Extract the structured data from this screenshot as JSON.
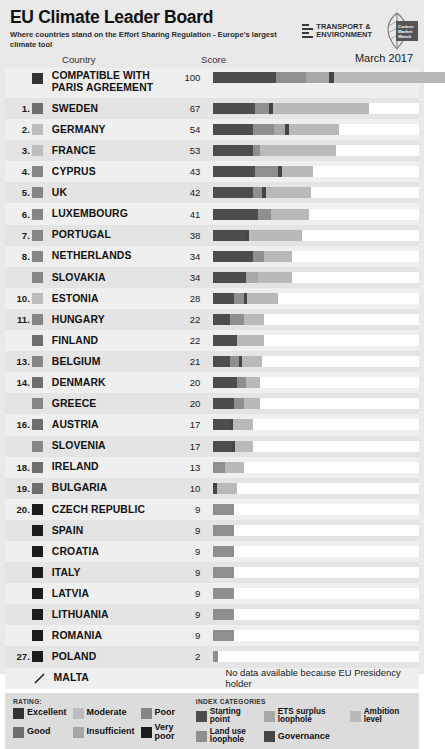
{
  "header": {
    "title": "EU Climate Leader Board",
    "subtitle": "Where countries stand on the Effort Sharing Regulation - Europe's largest climate tool",
    "org_logo_text": "TRANSPORT & ENVIRONMENT",
    "org_logo_line1": "TRANSPORT &",
    "org_logo_line2": "ENVIRONMENT",
    "cmw_line1": "Carbon",
    "cmw_line2": "Market",
    "cmw_line3": "Watch",
    "date": "March 2017"
  },
  "columns": {
    "country": "Country",
    "score": "Score"
  },
  "colors": {
    "starting_point": "#4d4d4d",
    "land_use": "#8f8f8f",
    "ets_surplus": "#a8a8a8",
    "governance": "#454545",
    "ambition": "#b9b9b9",
    "rating_excellent": "#333333",
    "rating_good": "#6e6e6e",
    "rating_moderate": "#bdbdbd",
    "rating_insufficient": "#a5a5a5",
    "rating_poor": "#858585",
    "rating_very_poor": "#1c1c1c",
    "bar_track": "#ffffff",
    "page_background": "#e9e9e9"
  },
  "chart_data": {
    "type": "bar",
    "title": "EU Climate Leader Board",
    "subtitle": "Where countries stand on the Effort Sharing Regulation - Europe's largest climate tool",
    "xlabel": "Score",
    "ylabel": "Country",
    "xlim": [
      0,
      100
    ],
    "grid": false,
    "legend": "bottom",
    "stacked": true,
    "segment_names": [
      "Starting point",
      "Land use loophole",
      "ETS surplus loophole",
      "Governance",
      "Ambition level"
    ],
    "categories": [
      "COMPATIBLE WITH PARIS AGREEMENT",
      "SWEDEN",
      "GERMANY",
      "FRANCE",
      "CYPRUS",
      "UK",
      "LUXEMBOURG",
      "PORTUGAL",
      "NETHERLANDS",
      "SLOVAKIA",
      "ESTONIA",
      "HUNGARY",
      "FINLAND",
      "BELGIUM",
      "DENMARK",
      "GREECE",
      "AUSTRIA",
      "SLOVENIA",
      "IRELAND",
      "BULGARIA",
      "CZECH REPUBLIC",
      "SPAIN",
      "CROATIA",
      "ITALY",
      "LATVIA",
      "LITHUANIA",
      "ROMANIA",
      "POLAND",
      "MALTA"
    ],
    "values": [
      100,
      67,
      54,
      53,
      43,
      42,
      41,
      38,
      34,
      34,
      28,
      22,
      22,
      21,
      20,
      20,
      17,
      17,
      13,
      10,
      9,
      9,
      9,
      9,
      9,
      9,
      9,
      2,
      null
    ]
  },
  "rows": [
    {
      "rank": "",
      "country": "COMPATIBLE WITH PARIS AGREEMENT",
      "score": "100",
      "rating": "excellent",
      "segments": [
        {
          "cat": "starting_point",
          "v": 27
        },
        {
          "cat": "land_use",
          "v": 13
        },
        {
          "cat": "ets_surplus",
          "v": 10
        },
        {
          "cat": "governance",
          "v": 2
        },
        {
          "cat": "ambition",
          "v": 48
        }
      ]
    },
    {
      "rank": "1.",
      "country": "SWEDEN",
      "score": "67",
      "rating": "good",
      "segments": [
        {
          "cat": "starting_point",
          "v": 18
        },
        {
          "cat": "land_use",
          "v": 6
        },
        {
          "cat": "governance",
          "v": 1.5
        },
        {
          "cat": "ambition",
          "v": 41.5
        }
      ]
    },
    {
      "rank": "2.",
      "country": "GERMANY",
      "score": "54",
      "rating": "moderate",
      "segments": [
        {
          "cat": "starting_point",
          "v": 17
        },
        {
          "cat": "land_use",
          "v": 9
        },
        {
          "cat": "ets_surplus",
          "v": 5
        },
        {
          "cat": "governance",
          "v": 1.5
        },
        {
          "cat": "ambition",
          "v": 21.5
        }
      ]
    },
    {
      "rank": "3.",
      "country": "FRANCE",
      "score": "53",
      "rating": "moderate",
      "segments": [
        {
          "cat": "starting_point",
          "v": 17
        },
        {
          "cat": "land_use",
          "v": 3
        },
        {
          "cat": "ambition",
          "v": 33
        }
      ]
    },
    {
      "rank": "4.",
      "country": "CYPRUS",
      "score": "43",
      "rating": "poor",
      "segments": [
        {
          "cat": "starting_point",
          "v": 18
        },
        {
          "cat": "land_use",
          "v": 10
        },
        {
          "cat": "governance",
          "v": 1.5
        },
        {
          "cat": "ambition",
          "v": 13.5
        }
      ]
    },
    {
      "rank": "5.",
      "country": "UK",
      "score": "42",
      "rating": "poor",
      "segments": [
        {
          "cat": "starting_point",
          "v": 17
        },
        {
          "cat": "land_use",
          "v": 4
        },
        {
          "cat": "governance",
          "v": 1.5
        },
        {
          "cat": "ambition",
          "v": 19.5
        }
      ]
    },
    {
      "rank": "6.",
      "country": "LUXEMBOURG",
      "score": "41",
      "rating": "poor",
      "segments": [
        {
          "cat": "starting_point",
          "v": 19
        },
        {
          "cat": "land_use",
          "v": 6
        },
        {
          "cat": "ambition",
          "v": 16
        }
      ]
    },
    {
      "rank": "7.",
      "country": "PORTUGAL",
      "score": "38",
      "rating": "poor",
      "segments": [
        {
          "cat": "starting_point",
          "v": 14
        },
        {
          "cat": "governance",
          "v": 1.5
        },
        {
          "cat": "ambition",
          "v": 22.5
        }
      ]
    },
    {
      "rank": "8.",
      "country": "NETHERLANDS",
      "score": "34",
      "rating": "poor",
      "segments": [
        {
          "cat": "starting_point",
          "v": 17
        },
        {
          "cat": "land_use",
          "v": 5
        },
        {
          "cat": "ambition",
          "v": 12
        }
      ]
    },
    {
      "rank": "",
      "country": "SLOVAKIA",
      "score": "34",
      "rating": "poor",
      "segments": [
        {
          "cat": "starting_point",
          "v": 14
        },
        {
          "cat": "ets_surplus",
          "v": 5
        },
        {
          "cat": "ambition",
          "v": 15
        }
      ]
    },
    {
      "rank": "10.",
      "country": "ESTONIA",
      "score": "28",
      "rating": "moderate",
      "segments": [
        {
          "cat": "starting_point",
          "v": 9
        },
        {
          "cat": "land_use",
          "v": 4
        },
        {
          "cat": "governance",
          "v": 1.5
        },
        {
          "cat": "ambition",
          "v": 13.5
        }
      ]
    },
    {
      "rank": "11.",
      "country": "HUNGARY",
      "score": "22",
      "rating": "poor",
      "segments": [
        {
          "cat": "starting_point",
          "v": 7
        },
        {
          "cat": "land_use",
          "v": 6
        },
        {
          "cat": "ambition",
          "v": 9
        }
      ]
    },
    {
      "rank": "",
      "country": "FINLAND",
      "score": "22",
      "rating": "good",
      "segments": [
        {
          "cat": "starting_point",
          "v": 10
        },
        {
          "cat": "ambition",
          "v": 12
        }
      ]
    },
    {
      "rank": "13.",
      "country": "BELGIUM",
      "score": "21",
      "rating": "poor",
      "segments": [
        {
          "cat": "starting_point",
          "v": 7
        },
        {
          "cat": "land_use",
          "v": 4
        },
        {
          "cat": "governance",
          "v": 1.5
        },
        {
          "cat": "ambition",
          "v": 8.5
        }
      ]
    },
    {
      "rank": "14.",
      "country": "DENMARK",
      "score": "20",
      "rating": "good",
      "segments": [
        {
          "cat": "starting_point",
          "v": 10
        },
        {
          "cat": "land_use",
          "v": 4
        },
        {
          "cat": "ambition",
          "v": 6
        }
      ]
    },
    {
      "rank": "",
      "country": "GREECE",
      "score": "20",
      "rating": "poor",
      "segments": [
        {
          "cat": "starting_point",
          "v": 9
        },
        {
          "cat": "land_use",
          "v": 4
        },
        {
          "cat": "ambition",
          "v": 7
        }
      ]
    },
    {
      "rank": "16.",
      "country": "AUSTRIA",
      "score": "17",
      "rating": "good",
      "segments": [
        {
          "cat": "starting_point",
          "v": 7
        },
        {
          "cat": "governance",
          "v": 1.5
        },
        {
          "cat": "ambition",
          "v": 8.5
        }
      ]
    },
    {
      "rank": "",
      "country": "SLOVENIA",
      "score": "17",
      "rating": "poor",
      "segments": [
        {
          "cat": "starting_point",
          "v": 8
        },
        {
          "cat": "governance",
          "v": 1.5
        },
        {
          "cat": "ambition",
          "v": 7.5
        }
      ]
    },
    {
      "rank": "18.",
      "country": "IRELAND",
      "score": "13",
      "rating": "good",
      "segments": [
        {
          "cat": "land_use",
          "v": 5
        },
        {
          "cat": "ambition",
          "v": 8
        }
      ]
    },
    {
      "rank": "19.",
      "country": "BULGARIA",
      "score": "10",
      "rating": "good",
      "segments": [
        {
          "cat": "governance",
          "v": 1.5
        },
        {
          "cat": "ambition",
          "v": 8.5
        }
      ]
    },
    {
      "rank": "20.",
      "country": "CZECH REPUBLIC",
      "score": "9",
      "rating": "very_poor",
      "segments": [
        {
          "cat": "land_use",
          "v": 9
        }
      ]
    },
    {
      "rank": "",
      "country": "SPAIN",
      "score": "9",
      "rating": "very_poor",
      "segments": [
        {
          "cat": "land_use",
          "v": 9
        }
      ]
    },
    {
      "rank": "",
      "country": "CROATIA",
      "score": "9",
      "rating": "very_poor",
      "segments": [
        {
          "cat": "land_use",
          "v": 9
        }
      ]
    },
    {
      "rank": "",
      "country": "ITALY",
      "score": "9",
      "rating": "very_poor",
      "segments": [
        {
          "cat": "land_use",
          "v": 9
        }
      ]
    },
    {
      "rank": "",
      "country": "LATVIA",
      "score": "9",
      "rating": "very_poor",
      "segments": [
        {
          "cat": "land_use",
          "v": 9
        }
      ]
    },
    {
      "rank": "",
      "country": "LITHUANIA",
      "score": "9",
      "rating": "very_poor",
      "segments": [
        {
          "cat": "land_use",
          "v": 9
        }
      ]
    },
    {
      "rank": "",
      "country": "ROMANIA",
      "score": "9",
      "rating": "very_poor",
      "segments": [
        {
          "cat": "land_use",
          "v": 9
        }
      ]
    },
    {
      "rank": "27.",
      "country": "POLAND",
      "score": "2",
      "rating": "very_poor",
      "segments": [
        {
          "cat": "land_use",
          "v": 2
        }
      ]
    },
    {
      "rank": "",
      "country": "MALTA",
      "score": "",
      "rating": "nodata",
      "no_data_text": "No data available because EU Presidency holder",
      "segments": []
    }
  ],
  "legend": {
    "rating_title": "RATING:",
    "rating_items": [
      {
        "label": "Excellent",
        "color_key": "rating_excellent"
      },
      {
        "label": "Moderate",
        "color_key": "rating_moderate"
      },
      {
        "label": "Poor",
        "color_key": "rating_poor"
      },
      {
        "label": "Good",
        "color_key": "rating_good"
      },
      {
        "label": "Insufficient",
        "color_key": "rating_insufficient"
      },
      {
        "label": "Very poor",
        "color_key": "rating_very_poor"
      }
    ],
    "categories_title": "INDEX CATEGORIES",
    "category_items": [
      {
        "label": "Starting point",
        "color_key": "starting_point"
      },
      {
        "label": "ETS surplus loophole",
        "color_key": "ets_surplus"
      },
      {
        "label": "Ambition level",
        "color_key": "ambition"
      },
      {
        "label": "Land use loophole",
        "color_key": "land_use"
      },
      {
        "label": "Governance",
        "color_key": "governance"
      }
    ]
  }
}
